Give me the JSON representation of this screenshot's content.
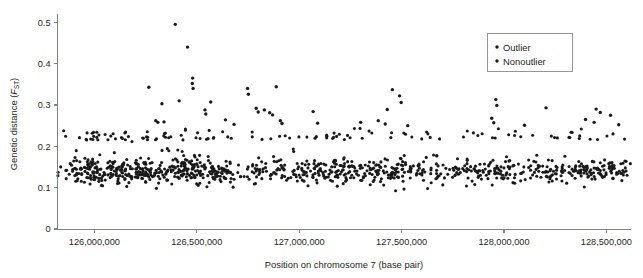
{
  "figure": {
    "name": "genetic-distance-scatter",
    "background_color": "#ffffff",
    "point_color": "#1a1a1a",
    "axis_color": "#808285"
  },
  "axes": {
    "y": {
      "title_main": "Genetic distance (",
      "title_italic": "F",
      "title_sub": "ST",
      "title_close": ")",
      "ticks": [
        "0",
        "0.1",
        "0.2",
        "0.3",
        "0.4",
        "0.5"
      ],
      "tick_values": [
        0,
        0.1,
        0.2,
        0.3,
        0.4,
        0.5
      ],
      "range": [
        0,
        0.52
      ]
    },
    "x": {
      "title": "Position on chromosome 7 (base pair)",
      "ticks": [
        "126,000,000",
        "126,500,000",
        "127,000,000",
        "127,500,000",
        "128,000,000",
        "128,500,000"
      ],
      "tick_values": [
        126000000,
        126500000,
        127000000,
        127500000,
        128000000,
        128500000
      ],
      "range": [
        125820000,
        128620000
      ]
    }
  },
  "legend": {
    "position": "top-right",
    "items": [
      {
        "label": "Outlier",
        "color": "#1a1a1a",
        "marker": "dot"
      },
      {
        "label": "Nonoutlier",
        "color": "#1a1a1a",
        "marker": "dot"
      }
    ]
  },
  "chart_data": {
    "type": "scatter",
    "title": "",
    "xlabel": "Position on chromosome 7 (base pair)",
    "ylabel": "Genetic distance (FST)",
    "xlim": [
      125820000,
      128620000
    ],
    "ylim": [
      0,
      0.52
    ],
    "grid": false,
    "legend_position": "top-right",
    "series": [
      {
        "name": "Outlier",
        "color": "#1a1a1a",
        "points": [
          [
            126395000,
            0.495
          ],
          [
            126455000,
            0.44
          ],
          [
            126480000,
            0.365
          ],
          [
            126478000,
            0.352
          ],
          [
            126482000,
            0.34
          ],
          [
            126266000,
            0.343
          ],
          [
            126748000,
            0.34
          ],
          [
            126752000,
            0.326
          ],
          [
            126888000,
            0.344
          ],
          [
            126414000,
            0.31
          ],
          [
            126330000,
            0.303
          ],
          [
            126568000,
            0.307
          ],
          [
            127455000,
            0.337
          ],
          [
            127490000,
            0.322
          ],
          [
            127498000,
            0.306
          ],
          [
            127960000,
            0.313
          ],
          [
            127965000,
            0.299
          ],
          [
            126540000,
            0.288
          ],
          [
            126544000,
            0.278
          ],
          [
            126790000,
            0.292
          ],
          [
            126800000,
            0.283
          ],
          [
            126830000,
            0.288
          ],
          [
            126856000,
            0.281
          ],
          [
            126870000,
            0.276
          ],
          [
            127068000,
            0.284
          ],
          [
            127430000,
            0.289
          ],
          [
            128205000,
            0.293
          ],
          [
            128450000,
            0.29
          ],
          [
            128470000,
            0.282
          ],
          [
            128520000,
            0.275
          ],
          [
            126300000,
            0.262
          ],
          [
            126310000,
            0.258
          ],
          [
            126340000,
            0.259
          ],
          [
            126640000,
            0.264
          ],
          [
            126682000,
            0.253
          ],
          [
            126908000,
            0.262
          ],
          [
            126916000,
            0.255
          ],
          [
            127090000,
            0.256
          ],
          [
            127300000,
            0.258
          ],
          [
            127386000,
            0.262
          ],
          [
            127420000,
            0.254
          ],
          [
            127530000,
            0.25
          ],
          [
            127940000,
            0.268
          ],
          [
            127950000,
            0.257
          ],
          [
            128100000,
            0.251
          ],
          [
            128398000,
            0.265
          ],
          [
            128440000,
            0.258
          ],
          [
            128560000,
            0.252
          ]
        ]
      },
      {
        "name": "Nonoutlier",
        "color": "#1a1a1a",
        "n_points": 980,
        "description": "Dense band of nonoutlier SNPs with FST mostly between 0.085 and 0.21, densest between 125.9e6 and 126.65e6, a sparse gap near 126.72e6, moderate density across 126.8e6-128.6e6 with local spikes near 127.45e6, 127.95e6 and 128.45e6.",
        "band": {
          "low": 0.085,
          "high": 0.215,
          "center": 0.14
        }
      }
    ]
  }
}
